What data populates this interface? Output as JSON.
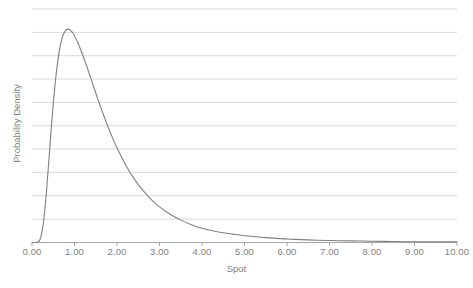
{
  "chart_data": {
    "type": "line",
    "title": "",
    "subtitle": "",
    "xlabel": "Spot",
    "ylabel": "Probability Density",
    "xlim": [
      0,
      10
    ],
    "ylim": [
      0,
      0.72
    ],
    "grid": true,
    "grid_axis": "y",
    "grid_lines": 10,
    "legend": "none",
    "x_tick_labels": [
      "0.00",
      "1.00",
      "2.00",
      "3.00",
      "4.00",
      "5.00",
      "6.00",
      "7.00",
      "8.00",
      "9.00",
      "10.00"
    ],
    "x_tick_values": [
      0,
      1,
      2,
      3,
      4,
      5,
      6,
      7,
      8,
      9,
      10
    ],
    "y_tick_labels": [],
    "series": [
      {
        "name": "Probability Density",
        "color": "#808080",
        "line_width": 1,
        "distribution": "lognormal",
        "peak_x": 1.05,
        "peak_y": 0.655,
        "x": [
          0.0,
          0.05,
          0.1,
          0.15,
          0.2,
          0.25,
          0.3,
          0.35,
          0.4,
          0.45,
          0.5,
          0.55,
          0.6,
          0.65,
          0.7,
          0.75,
          0.8,
          0.85,
          0.9,
          0.95,
          1.0,
          1.05,
          1.1,
          1.2,
          1.3,
          1.4,
          1.5,
          1.6,
          1.7,
          1.8,
          1.9,
          2.0,
          2.2,
          2.4,
          2.6,
          2.8,
          3.0,
          3.25,
          3.5,
          3.75,
          4.0,
          4.25,
          4.5,
          4.75,
          5.0,
          5.5,
          6.0,
          6.5,
          7.0,
          7.5,
          8.0,
          8.5,
          9.0,
          9.5,
          10.0
        ],
        "y": [
          0.0,
          0.0,
          0.0,
          0.002,
          0.013,
          0.044,
          0.098,
          0.173,
          0.26,
          0.347,
          0.428,
          0.497,
          0.553,
          0.596,
          0.626,
          0.645,
          0.655,
          0.658,
          0.655,
          0.648,
          0.637,
          0.624,
          0.61,
          0.576,
          0.539,
          0.5,
          0.461,
          0.423,
          0.387,
          0.353,
          0.321,
          0.292,
          0.24,
          0.197,
          0.162,
          0.133,
          0.11,
          0.087,
          0.069,
          0.055,
          0.044,
          0.036,
          0.03,
          0.025,
          0.021,
          0.015,
          0.011,
          0.008,
          0.006,
          0.005,
          0.004,
          0.003,
          0.002,
          0.002,
          0.002
        ]
      }
    ]
  },
  "style": {
    "grid_color": "#d9d9d9",
    "axis_color": "#a6a6a6",
    "text_color": "#7f7f7f",
    "curve_color": "#808080",
    "background": "#ffffff"
  }
}
